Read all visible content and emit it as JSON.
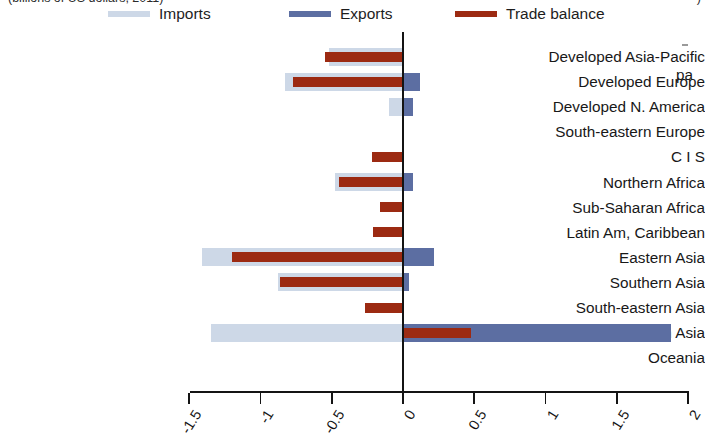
{
  "top_caption": {
    "left_fragment": "(billions of US dollars, 2011)",
    "right_fragment": ")"
  },
  "side_text": {
    "fragment": "pa"
  },
  "legend": {
    "items": [
      {
        "label": "Imports",
        "color": "#cdd8e7",
        "key": "imports"
      },
      {
        "label": "Exports",
        "color": "#5c6ea2",
        "key": "exports"
      },
      {
        "label": "Trade balance",
        "color": "#9c2a12",
        "key": "balance"
      }
    ]
  },
  "chart_data": {
    "type": "bar",
    "orientation": "horizontal",
    "title": "",
    "xlabel": "",
    "ylabel": "",
    "xlim": [
      -1.5,
      2.0
    ],
    "xticks": [
      -1.5,
      -1,
      -0.5,
      0,
      0.5,
      1,
      1.5,
      2
    ],
    "xtick_labels": [
      "-1.5",
      "-1",
      "-0.5",
      "0",
      "0.5",
      "1",
      "1.5",
      "2"
    ],
    "grid": false,
    "legend_position": "top",
    "zero_line": true,
    "categories": [
      "Developed Asia-Pacific",
      "Developed Europe",
      "Developed N. America",
      "South-eastern Europe",
      "C I S",
      "Northern Africa",
      "Sub-Saharan Africa",
      "Latin Am, Caribbean",
      "Eastern Asia",
      "Southern Asia",
      "South-eastern Asia",
      "Western Asia",
      "Oceania"
    ],
    "series": [
      {
        "name": "Imports",
        "color": "#cdd8e7",
        "values": [
          -0.52,
          -0.83,
          -0.1,
          0.0,
          0.0,
          -0.48,
          0.0,
          0.0,
          -1.41,
          -0.88,
          0.0,
          -1.35,
          0.0
        ]
      },
      {
        "name": "Exports",
        "color": "#5c6ea2",
        "values": [
          0.0,
          0.12,
          0.07,
          0.0,
          0.0,
          0.07,
          0.0,
          0.0,
          0.22,
          0.04,
          0.0,
          1.88,
          0.0
        ]
      },
      {
        "name": "Trade balance",
        "color": "#9c2a12",
        "values": [
          -0.55,
          -0.77,
          0.0,
          0.0,
          -0.22,
          -0.45,
          -0.16,
          -0.21,
          -1.2,
          -0.86,
          -0.27,
          0.48,
          0.0
        ]
      }
    ]
  }
}
